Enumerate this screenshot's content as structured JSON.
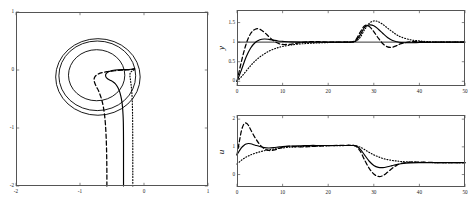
{
  "figure": {
    "background": "#ffffff",
    "line_color": "#000000",
    "frame_color": "#555555"
  },
  "chart_data": [
    {
      "id": "phase-plane",
      "type": "line",
      "title": "",
      "xlabel": "",
      "ylabel": "",
      "xlim": [
        -2,
        1
      ],
      "ylim": [
        -2,
        1
      ],
      "xticks": [
        -2,
        -1,
        0,
        1
      ],
      "xticklabels": [
        "-2",
        "-1",
        "0",
        "1"
      ],
      "yticks": [
        -2,
        -1,
        0,
        1
      ],
      "yticklabels": [
        "-2",
        "-1",
        "0",
        "1"
      ],
      "grid": false,
      "legend": "none",
      "description": "Cartesian phase-plane trajectories converging onto a circular limit cycle centred near (-0.72, -0.12)",
      "series": [
        {
          "name": "trajectory-solid",
          "style": "solid",
          "x": [
            -0.32,
            -0.32,
            -0.32,
            -0.32,
            -0.321,
            -0.323,
            -0.327,
            -0.334,
            -0.345,
            -0.362,
            -0.385,
            -0.415,
            -0.45,
            -0.49,
            -0.53,
            -0.565,
            -0.59,
            -0.6,
            -0.595,
            -0.575,
            -0.545,
            -0.5,
            -0.45,
            -0.4,
            -0.345,
            -0.29,
            -0.24,
            -0.2,
            -0.17,
            -0.155,
            -0.15
          ],
          "y": [
            -2.0,
            -1.75,
            -1.5,
            -1.25,
            -1.05,
            -0.9,
            -0.78,
            -0.66,
            -0.55,
            -0.45,
            -0.36,
            -0.29,
            -0.235,
            -0.2,
            -0.175,
            -0.155,
            -0.13,
            -0.1,
            -0.07,
            -0.045,
            -0.025,
            -0.01,
            0.0,
            0.004,
            0.006,
            0.007,
            0.009,
            0.012,
            0.018,
            0.022,
            0.025
          ]
        },
        {
          "name": "trajectory-dashed",
          "style": "dashed",
          "x": [
            -0.58,
            -0.58,
            -0.582,
            -0.586,
            -0.593,
            -0.603,
            -0.617,
            -0.636,
            -0.659,
            -0.685,
            -0.712,
            -0.738,
            -0.76,
            -0.775,
            -0.78,
            -0.773,
            -0.755,
            -0.725,
            -0.685,
            -0.635,
            -0.578,
            -0.518,
            -0.456,
            -0.395,
            -0.337,
            -0.283,
            -0.236,
            -0.197,
            -0.17,
            -0.155,
            -0.148
          ],
          "y": [
            -2.0,
            -1.78,
            -1.55,
            -1.33,
            -1.12,
            -0.93,
            -0.77,
            -0.63,
            -0.52,
            -0.43,
            -0.355,
            -0.3,
            -0.25,
            -0.205,
            -0.165,
            -0.13,
            -0.1,
            -0.075,
            -0.055,
            -0.04,
            -0.028,
            -0.02,
            -0.013,
            -0.008,
            -0.004,
            0.0,
            0.004,
            0.009,
            0.015,
            0.02,
            0.024
          ]
        },
        {
          "name": "trajectory-dotted",
          "style": "dotted",
          "x": [
            -0.175,
            -0.175,
            -0.175,
            -0.175,
            -0.176,
            -0.177,
            -0.179,
            -0.182,
            -0.186,
            -0.191,
            -0.197,
            -0.203,
            -0.209,
            -0.214,
            -0.218,
            -0.22,
            -0.22,
            -0.217,
            -0.212,
            -0.205,
            -0.197,
            -0.188,
            -0.179,
            -0.17,
            -0.163,
            -0.157,
            -0.152,
            -0.149,
            -0.147,
            -0.146,
            -0.146
          ],
          "y": [
            -2.0,
            -1.78,
            -1.56,
            -1.34,
            -1.12,
            -0.92,
            -0.74,
            -0.59,
            -0.47,
            -0.375,
            -0.3,
            -0.24,
            -0.19,
            -0.15,
            -0.12,
            -0.095,
            -0.075,
            -0.058,
            -0.045,
            -0.034,
            -0.025,
            -0.018,
            -0.012,
            -0.007,
            -0.003,
            0.0,
            0.004,
            0.008,
            0.013,
            0.018,
            0.022
          ]
        },
        {
          "name": "limit-cycle-outer",
          "style": "solid",
          "shape": "circle",
          "cx": -0.72,
          "cy": -0.12,
          "r": 0.66
        },
        {
          "name": "limit-cycle-middle",
          "style": "solid",
          "shape": "circle",
          "cx": -0.73,
          "cy": -0.1,
          "r": 0.6
        },
        {
          "name": "limit-cycle-inner",
          "style": "solid",
          "shape": "circle",
          "cx": -0.74,
          "cy": -0.09,
          "r": 0.44
        }
      ]
    },
    {
      "id": "y-response",
      "type": "line",
      "title": "",
      "xlabel": "",
      "ylabel": "y",
      "xlim": [
        0,
        50
      ],
      "ylim": [
        -0.12,
        1.82
      ],
      "xticks": [
        0,
        10,
        20,
        30,
        40,
        50
      ],
      "xticklabels": [
        "0",
        "10",
        "20",
        "30",
        "40",
        "50"
      ],
      "yticks": [
        0,
        0.5,
        1,
        1.5
      ],
      "yticklabels": [
        "0",
        "0.5",
        "1",
        "1.5"
      ],
      "grid": false,
      "legend": "none",
      "reference_level": 1.0,
      "description": "Step responses of output y: rise from 0 toward setpoint 1, then a disturbance overshoot near t = 28",
      "series": [
        {
          "name": "response-solid",
          "style": "solid",
          "x": [
            0,
            1,
            2,
            3,
            4,
            5,
            6,
            7,
            8,
            9,
            10,
            12,
            14,
            16,
            18,
            20,
            22,
            24,
            25,
            26,
            27,
            28,
            29,
            30,
            31,
            32,
            33,
            34,
            35,
            36,
            38,
            40,
            42,
            44,
            46,
            48,
            50
          ],
          "y": [
            0,
            0.3,
            0.62,
            0.85,
            0.99,
            1.06,
            1.08,
            1.07,
            1.05,
            1.03,
            1.02,
            1.005,
            1.0,
            1.0,
            1.0,
            1.0,
            1.0,
            1.0,
            1.0,
            1.03,
            1.18,
            1.38,
            1.44,
            1.42,
            1.33,
            1.22,
            1.12,
            1.05,
            1.01,
            0.99,
            0.985,
            0.99,
            0.995,
            1.0,
            1.0,
            1.0,
            1.0
          ]
        },
        {
          "name": "response-dashed",
          "style": "dashed",
          "x": [
            0,
            1,
            2,
            3,
            4,
            5,
            6,
            7,
            8,
            9,
            10,
            12,
            14,
            16,
            18,
            20,
            22,
            24,
            25,
            26,
            27,
            28,
            29,
            30,
            31,
            32,
            33,
            34,
            35,
            36,
            38,
            40,
            42,
            44,
            46,
            48,
            50
          ],
          "y": [
            0,
            0.52,
            0.95,
            1.22,
            1.33,
            1.33,
            1.25,
            1.14,
            1.04,
            0.97,
            0.94,
            0.95,
            0.99,
            1.01,
            1.01,
            1.0,
            1.0,
            1.0,
            1.0,
            1.05,
            1.25,
            1.42,
            1.4,
            1.27,
            1.1,
            0.96,
            0.88,
            0.87,
            0.91,
            0.96,
            1.01,
            1.01,
            1.0,
            1.0,
            1.0,
            1.0,
            1.0
          ]
        },
        {
          "name": "response-dotted",
          "style": "dotted",
          "x": [
            0,
            1,
            2,
            3,
            4,
            5,
            6,
            7,
            8,
            9,
            10,
            12,
            14,
            16,
            18,
            20,
            22,
            24,
            25,
            26,
            27,
            28,
            29,
            30,
            31,
            32,
            33,
            34,
            35,
            36,
            38,
            40,
            42,
            44,
            46,
            48,
            50
          ],
          "y": [
            0,
            0.12,
            0.26,
            0.4,
            0.52,
            0.62,
            0.7,
            0.77,
            0.82,
            0.86,
            0.89,
            0.93,
            0.955,
            0.97,
            0.98,
            0.99,
            0.995,
            1.0,
            1.0,
            1.02,
            1.12,
            1.32,
            1.48,
            1.54,
            1.52,
            1.45,
            1.36,
            1.27,
            1.19,
            1.13,
            1.06,
            1.03,
            1.01,
            1.0,
            1.0,
            1.0,
            1.0
          ]
        }
      ]
    },
    {
      "id": "u-control",
      "type": "line",
      "title": "",
      "xlabel": "",
      "ylabel": "u",
      "xlim": [
        0,
        50
      ],
      "ylim": [
        -0.45,
        2.15
      ],
      "xticks": [
        0,
        10,
        20,
        30,
        40,
        50
      ],
      "xticklabels": [
        "0",
        "10",
        "20",
        "30",
        "40",
        "50"
      ],
      "yticks": [
        0,
        1,
        2
      ],
      "yticklabels": [
        "0",
        "1",
        "2"
      ],
      "grid": false,
      "legend": "none",
      "description": "Control signal u: initial transient peak, plateau near 1, then drop and undershoot after t = 26",
      "series": [
        {
          "name": "control-solid",
          "style": "solid",
          "x": [
            0,
            0.5,
            1,
            1.5,
            2,
            2.5,
            3,
            4,
            5,
            6,
            7,
            8,
            9,
            10,
            11,
            12,
            14,
            16,
            18,
            20,
            22,
            24,
            25,
            26,
            27,
            28,
            29,
            30,
            31,
            32,
            33,
            34,
            35,
            36,
            38,
            40,
            42,
            44,
            46,
            48,
            50
          ],
          "y": [
            0.72,
            0.85,
            0.97,
            1.05,
            1.1,
            1.12,
            1.11,
            1.06,
            1.01,
            0.97,
            0.96,
            0.97,
            0.99,
            1.01,
            1.02,
            1.03,
            1.04,
            1.05,
            1.05,
            1.05,
            1.05,
            1.05,
            1.05,
            1.04,
            0.92,
            0.7,
            0.48,
            0.33,
            0.26,
            0.25,
            0.28,
            0.32,
            0.36,
            0.39,
            0.42,
            0.43,
            0.43,
            0.43,
            0.43,
            0.43,
            0.43
          ]
        },
        {
          "name": "control-dashed",
          "style": "dashed",
          "x": [
            0,
            0.5,
            1,
            1.5,
            2,
            2.5,
            3,
            4,
            5,
            6,
            7,
            8,
            9,
            10,
            11,
            12,
            14,
            16,
            18,
            20,
            22,
            24,
            25,
            26,
            27,
            28,
            29,
            30,
            31,
            32,
            33,
            34,
            35,
            36,
            38,
            40,
            42,
            44,
            46,
            48,
            50
          ],
          "y": [
            0.7,
            1.18,
            1.6,
            1.82,
            1.86,
            1.78,
            1.62,
            1.32,
            1.08,
            0.93,
            0.87,
            0.88,
            0.93,
            0.99,
            1.02,
            1.02,
            1.0,
            1.01,
            1.03,
            1.04,
            1.05,
            1.05,
            1.05,
            1.03,
            0.85,
            0.52,
            0.22,
            0.02,
            -0.07,
            -0.04,
            0.08,
            0.22,
            0.33,
            0.4,
            0.45,
            0.45,
            0.44,
            0.43,
            0.43,
            0.43,
            0.43
          ]
        },
        {
          "name": "control-dotted",
          "style": "dotted",
          "x": [
            0,
            0.5,
            1,
            1.5,
            2,
            2.5,
            3,
            4,
            5,
            6,
            7,
            8,
            9,
            10,
            11,
            12,
            14,
            16,
            18,
            20,
            22,
            24,
            25,
            26,
            27,
            28,
            29,
            30,
            31,
            32,
            33,
            34,
            35,
            36,
            38,
            40,
            42,
            44,
            46,
            48,
            50
          ],
          "y": [
            0.38,
            0.45,
            0.52,
            0.58,
            0.63,
            0.67,
            0.71,
            0.77,
            0.82,
            0.86,
            0.89,
            0.92,
            0.94,
            0.96,
            0.98,
            0.99,
            1.01,
            1.02,
            1.03,
            1.04,
            1.04,
            1.05,
            1.05,
            1.04,
            0.99,
            0.9,
            0.8,
            0.71,
            0.64,
            0.58,
            0.54,
            0.51,
            0.49,
            0.47,
            0.45,
            0.44,
            0.435,
            0.43,
            0.43,
            0.43,
            0.43
          ]
        }
      ]
    }
  ]
}
